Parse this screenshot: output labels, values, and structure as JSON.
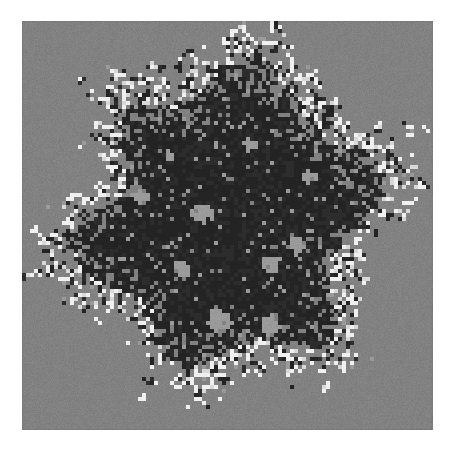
{
  "figure": {
    "kind": "percolation-cluster-image",
    "canvas_width": 457,
    "canvas_height": 452,
    "outer_background": "#ffffff"
  },
  "panel": {
    "x": 22,
    "y": 21,
    "width": 411,
    "height": 409,
    "background_color": "#818181",
    "grain_amplitude": 11,
    "edge_shadow": true
  },
  "grid": {
    "cell_size": 4,
    "cols": 103,
    "rows": 103
  },
  "palette": {
    "background_gray": "#818181",
    "occupied_dark": "#232323",
    "occupied_dark_alt": "#2c2c2c",
    "void_gray": "#9a9a9a",
    "highlight_white": "#f0f0f0",
    "highlight_white_dim": "#d8d8d8"
  },
  "cluster_model": {
    "seed": 20240517,
    "center_col": 51.5,
    "center_row": 51,
    "base_radius": 33.0,
    "core_radius": 19.0,
    "edge_softness": 7.5,
    "occupancy_core": 0.965,
    "occupancy_rim": 0.3,
    "void_probability_core": 0.055,
    "void_probability_mid": 0.105,
    "void_cluster_bias": 0.62,
    "highlight_band_inner": 0.8,
    "highlight_band_outer": 1.16,
    "highlight_probability": 0.155,
    "noise_octaves": 4,
    "noise_gain": 0.52,
    "noise_scale": 0.085,
    "arm_count": 6,
    "arm_amplitude": 0.3,
    "arm_phase_deg": 14,
    "lobes": [
      {
        "angle_deg": 90,
        "reach": 0.4,
        "width_deg": 19,
        "label": "north-spire"
      },
      {
        "angle_deg": 128,
        "reach": 0.26,
        "width_deg": 17,
        "label": "north-west-arm"
      },
      {
        "angle_deg": 52,
        "reach": 0.31,
        "width_deg": 18,
        "label": "north-east-arm"
      },
      {
        "angle_deg": 18,
        "reach": 0.28,
        "width_deg": 16,
        "label": "east-arm"
      },
      {
        "angle_deg": 176,
        "reach": 0.24,
        "width_deg": 15,
        "label": "west-arm"
      },
      {
        "angle_deg": 210,
        "reach": 0.25,
        "width_deg": 17,
        "label": "south-west-arm"
      },
      {
        "angle_deg": 250,
        "reach": 0.21,
        "width_deg": 15,
        "label": "south-arm"
      },
      {
        "angle_deg": 296,
        "reach": 0.3,
        "width_deg": 18,
        "label": "south-east-arm"
      },
      {
        "angle_deg": 338,
        "reach": 0.22,
        "width_deg": 14,
        "label": "east-south-arm"
      }
    ],
    "interior_voids": [
      {
        "col": 45,
        "row": 48,
        "radius": 2.6,
        "label": "central-void"
      },
      {
        "col": 40,
        "row": 62,
        "radius": 2.0,
        "label": "lower-left-void"
      },
      {
        "col": 62,
        "row": 61,
        "radius": 2.3,
        "label": "lower-right-void"
      },
      {
        "col": 49,
        "row": 75,
        "radius": 3.0,
        "label": "south-basin-void"
      },
      {
        "col": 62,
        "row": 76,
        "radius": 2.4,
        "label": "south-east-void"
      },
      {
        "col": 69,
        "row": 56,
        "radius": 1.9,
        "label": "east-void"
      },
      {
        "col": 30,
        "row": 44,
        "radius": 1.8,
        "label": "west-void"
      },
      {
        "col": 57,
        "row": 31,
        "radius": 1.6,
        "label": "north-void"
      },
      {
        "col": 72,
        "row": 39,
        "radius": 1.5,
        "label": "north-east-void"
      },
      {
        "col": 37,
        "row": 34,
        "radius": 1.4,
        "label": "north-west-void"
      }
    ]
  },
  "chart_data": {
    "type": "heatmap",
    "title": "",
    "xlabel": "",
    "ylabel": "",
    "grid": false,
    "legend": null,
    "categories": [
      "background",
      "occupied",
      "void",
      "highlight"
    ],
    "value_colors": [
      "#818181",
      "#232323",
      "#9a9a9a",
      "#f0f0f0"
    ],
    "nx": 103,
    "ny": 103,
    "xlim": [
      0,
      103
    ],
    "ylim": [
      0,
      103
    ]
  }
}
